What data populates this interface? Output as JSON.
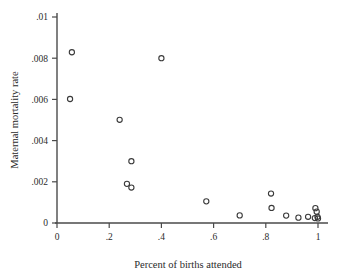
{
  "chart_data": {
    "type": "scatter",
    "title": "",
    "xlabel": "Percent of births attended",
    "ylabel": "Maternal mortality rate",
    "xlim": [
      0,
      1.06
    ],
    "ylim": [
      0,
      0.0102
    ],
    "grid": false,
    "legend": null,
    "xticks": [
      0,
      0.2,
      0.4,
      0.6,
      0.8,
      1
    ],
    "xtick_labels": [
      "0",
      ".2",
      ".4",
      ".6",
      ".8",
      "1"
    ],
    "yticks": [
      0,
      0.002,
      0.004,
      0.006,
      0.008,
      0.01
    ],
    "ytick_labels": [
      "0",
      ".002",
      ".004",
      ".006",
      ".008",
      ".01"
    ],
    "marker": "open-circle",
    "marker_radius_px": 2.6,
    "points": [
      {
        "x": 0.057,
        "y": 0.00829
      },
      {
        "x": 0.05,
        "y": 0.00602
      },
      {
        "x": 0.24,
        "y": 0.00501
      },
      {
        "x": 0.4,
        "y": 0.008
      },
      {
        "x": 0.285,
        "y": 0.003
      },
      {
        "x": 0.268,
        "y": 0.0019
      },
      {
        "x": 0.285,
        "y": 0.00172
      },
      {
        "x": 0.572,
        "y": 0.00105
      },
      {
        "x": 0.7,
        "y": 0.00037
      },
      {
        "x": 0.82,
        "y": 0.00143
      },
      {
        "x": 0.822,
        "y": 0.00073
      },
      {
        "x": 0.878,
        "y": 0.00036
      },
      {
        "x": 0.925,
        "y": 0.00026
      },
      {
        "x": 0.962,
        "y": 0.0003
      },
      {
        "x": 0.99,
        "y": 0.00072
      },
      {
        "x": 0.995,
        "y": 0.00055
      },
      {
        "x": 0.998,
        "y": 0.0003
      },
      {
        "x": 1.0,
        "y": 0.00022
      },
      {
        "x": 0.988,
        "y": 0.00024
      }
    ]
  },
  "labels": {
    "x_axis_title": "Percent of births attended",
    "y_axis_title": "Maternal mortality rate"
  }
}
